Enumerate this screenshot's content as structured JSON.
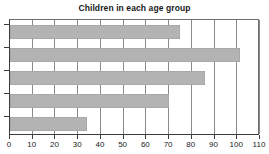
{
  "chart_data": {
    "type": "bar",
    "orientation": "horizontal",
    "title": "Children in each age group",
    "xlabel": "",
    "ylabel": "",
    "categories": [
      "",
      "",
      "",
      "",
      ""
    ],
    "values": [
      75,
      101,
      86,
      70,
      34
    ],
    "xlim": [
      0,
      110
    ],
    "xticks": [
      0,
      10,
      20,
      30,
      40,
      50,
      60,
      70,
      80,
      90,
      100,
      110
    ],
    "xtick_labels": [
      "0",
      "10",
      "20",
      "30",
      "40",
      "50",
      "60",
      "70",
      "80",
      "90",
      "100",
      "110"
    ],
    "ytick_labels": [
      "",
      "",
      "",
      "",
      ""
    ],
    "grid": true,
    "grid_axis": "x",
    "legend": false,
    "legend_position": "none",
    "bar_color": "#b3b3b3",
    "bar_edge_color": "#a8a8a8",
    "axis_color": "#3d3d3d",
    "grid_color": "#8a8a8a",
    "background_color": "#ffffff",
    "text_color": "#1a1a1a"
  }
}
